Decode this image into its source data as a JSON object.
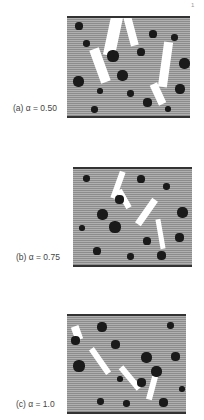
{
  "figure": {
    "panels": [
      {
        "id": "a",
        "label": "(a)  α = 0.50",
        "alpha": "0.50"
      },
      {
        "id": "b",
        "label": "(b)  α = 0.75",
        "alpha": "0.75"
      },
      {
        "id": "c",
        "label": "(c)  α = 1.0",
        "alpha": "1.0"
      }
    ],
    "corner_mark": "1"
  }
}
